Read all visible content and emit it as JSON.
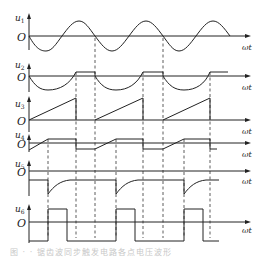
{
  "figure": {
    "rows": [
      {
        "label": "u",
        "sub": "1",
        "origin": "O",
        "xlabel": "ωt",
        "waveform": "sine"
      },
      {
        "label": "u",
        "sub": "2",
        "origin": "O",
        "xlabel": "ωt",
        "waveform": "rectified-negative-half-sine-with-plateau"
      },
      {
        "label": "u",
        "sub": "3",
        "origin": "O",
        "xlabel": "ωt",
        "waveform": "sawtooth-ramp"
      },
      {
        "label": "u",
        "sub": "4",
        "origin": "O",
        "xlabel": "ωt",
        "waveform": "clipped-ramp-step"
      },
      {
        "label": "u",
        "sub": "5",
        "origin": "O",
        "xlabel": "ωt",
        "waveform": "negative-spike-exponential-recovery"
      },
      {
        "label": "u",
        "sub": "6",
        "origin": "O",
        "xlabel": "ωt",
        "waveform": "rectangular-pulses"
      }
    ],
    "dashed_markers_x": [
      48,
      76,
      95,
      116,
      143,
      163,
      184,
      210
    ],
    "colors": {
      "line": "#222222",
      "background": "#ffffff",
      "caption": "#c8c8c8"
    }
  },
  "caption": {
    "text": "图 · · 锯齿波同步触发电路各点电压波形"
  }
}
